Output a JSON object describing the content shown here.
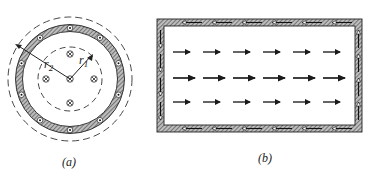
{
  "figure": {
    "panel_a": {
      "caption": "(a)",
      "description": "Cross-section of coaxial cylinder: hatched outer conducting shell with dot (out-of-page) current markers, inner dashed circle of radius r1 with cross (into-page) current markers",
      "labels": {
        "r1": "r",
        "r1_sub": "1",
        "r2": "r",
        "r2_sub": "2"
      },
      "outer_shell_dots": 10,
      "inner_crosses": 5,
      "colors": {
        "stroke": "#222222",
        "hatch": "#555555"
      }
    },
    "panel_b": {
      "caption": "(b)",
      "description": "Longitudinal section: hatched rectangular frame with circulating return-current arrows, interior field of rightward arrows",
      "interior_arrow_rows": 3,
      "interior_arrows_per_row": 6,
      "middle_row_emphasis": "longer arrows",
      "border_arrow_direction": "top: leftward, bottom: leftward, left: downward, right: upward",
      "colors": {
        "stroke": "#222222",
        "hatch": "#555555"
      }
    }
  }
}
